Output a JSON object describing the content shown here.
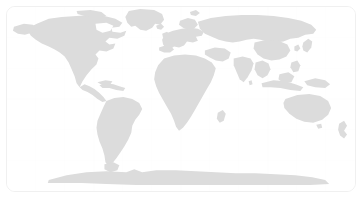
{
  "widget": {
    "name": "world-map",
    "type": "map",
    "title": "",
    "projection": "equirectangular",
    "background_color": "#ffffff",
    "land_color": "#dcdcdc",
    "graticule_color": "#fbfbfb",
    "border_color": "#f0f0f0",
    "border_radius_px": 9,
    "viewport": {
      "x": 6,
      "y": 6,
      "width": 350,
      "height": 186
    },
    "graticule": {
      "visible": true,
      "lon_step_deg": 30,
      "lat_step_deg": 30
    },
    "extent": {
      "lon_min": -180,
      "lon_max": 180,
      "lat_min": -90,
      "lat_max": 90
    },
    "labels": [],
    "markers": [],
    "legend": {
      "visible": false,
      "entries": []
    },
    "zoom_controls": {
      "visible": false
    },
    "attribution": ""
  },
  "chart_data": {
    "type": "map",
    "title": "",
    "xlabel": "",
    "ylabel": "",
    "regions": [
      "North America",
      "Greenland",
      "Central America",
      "Caribbean",
      "South America",
      "Europe",
      "Scandinavia",
      "British Isles",
      "Africa",
      "Madagascar",
      "Middle East",
      "Russia / North Asia",
      "India",
      "Southeast Asia",
      "China",
      "Japan",
      "Indonesia",
      "Philippines",
      "Australia",
      "New Zealand",
      "Antarctica"
    ],
    "values": [],
    "series": []
  }
}
